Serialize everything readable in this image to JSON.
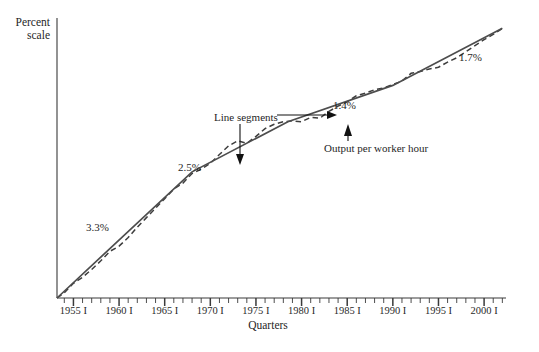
{
  "chart_data": {
    "type": "line",
    "title": "",
    "xlabel": "Quarters",
    "ylabel": "Percent scale",
    "grid": false,
    "legend": "none",
    "xlim": [
      "1953 I",
      "2002 I"
    ],
    "tick_labels": [
      "1955 I",
      "1960 I",
      "1965 I",
      "1970 I",
      "1975 I",
      "1980 I",
      "1985 I",
      "1990 I",
      "1995 I",
      "2000 I"
    ],
    "tick_years": [
      1955,
      1960,
      1965,
      1970,
      1975,
      1980,
      1985,
      1990,
      1995,
      2000
    ],
    "minor_tick_interval_years": 1,
    "series": [
      {
        "name": "Output per worker hour",
        "style": "dashed",
        "color": "#3d3d3d",
        "points": [
          [
            1953.2,
            0.0
          ],
          [
            1954.0,
            3.0
          ],
          [
            1955.0,
            8.5
          ],
          [
            1956.0,
            12.0
          ],
          [
            1957.0,
            16.5
          ],
          [
            1958.0,
            21.5
          ],
          [
            1959.0,
            27.0
          ],
          [
            1960.0,
            30.0
          ],
          [
            1961.0,
            35.0
          ],
          [
            1962.0,
            41.0
          ],
          [
            1963.0,
            46.5
          ],
          [
            1964.0,
            52.0
          ],
          [
            1965.0,
            57.5
          ],
          [
            1966.0,
            63.0
          ],
          [
            1967.0,
            66.5
          ],
          [
            1968.0,
            72.0
          ],
          [
            1969.0,
            74.5
          ],
          [
            1970.0,
            78.0
          ],
          [
            1971.0,
            83.0
          ],
          [
            1972.0,
            88.0
          ],
          [
            1973.0,
            91.0
          ],
          [
            1974.0,
            89.5
          ],
          [
            1975.0,
            93.5
          ],
          [
            1976.0,
            98.0
          ],
          [
            1977.0,
            100.5
          ],
          [
            1978.0,
            102.0
          ],
          [
            1979.0,
            102.5
          ],
          [
            1980.0,
            102.0
          ],
          [
            1981.0,
            104.5
          ],
          [
            1982.0,
            104.0
          ],
          [
            1983.0,
            108.0
          ],
          [
            1984.0,
            111.0
          ],
          [
            1985.0,
            113.5
          ],
          [
            1986.0,
            117.0
          ],
          [
            1987.0,
            118.5
          ],
          [
            1988.0,
            120.5
          ],
          [
            1989.0,
            121.5
          ],
          [
            1990.0,
            123.5
          ],
          [
            1991.0,
            125.5
          ],
          [
            1992.0,
            130.0
          ],
          [
            1993.0,
            131.0
          ],
          [
            1994.0,
            132.5
          ],
          [
            1995.0,
            133.5
          ],
          [
            1996.0,
            136.5
          ],
          [
            1997.0,
            139.0
          ],
          [
            1998.0,
            142.5
          ],
          [
            1999.0,
            146.0
          ],
          [
            2000.0,
            149.5
          ],
          [
            2001.0,
            152.5
          ],
          [
            2002.0,
            156.0
          ]
        ]
      },
      {
        "name": "Line segments",
        "style": "solid",
        "color": "#4a4a4a",
        "breakpoints_years": [
          1953.2,
          1968.0,
          1978.5,
          1990.0,
          2002.0
        ],
        "breakpoints_values": [
          0.0,
          73.0,
          102.0,
          123.0,
          156.0
        ]
      }
    ],
    "segment_growth_rates": [
      {
        "label": "3.3%",
        "period": "1953 I - 1968 I"
      },
      {
        "label": "2.5%",
        "period": "1968 I - 1978 IV"
      },
      {
        "label": "1.4%",
        "period": "1978 IV - 1990 I"
      },
      {
        "label": "1.7%",
        "period": "1990 I - 2002 I"
      }
    ],
    "annotations": [
      {
        "text": "Line segments",
        "target": "solid-line"
      },
      {
        "text": "Output per worker hour",
        "target": "dashed-line"
      }
    ]
  },
  "axes": {
    "y_label_line1": "Percent",
    "y_label_line2": "scale",
    "x_label": "Quarters"
  },
  "colors": {
    "axis": "#3a3a3a",
    "solid_line": "#4d4d4d",
    "dashed_line": "#3d3d3d",
    "annotation": "#1f1f1f",
    "background": "#ffffff"
  }
}
